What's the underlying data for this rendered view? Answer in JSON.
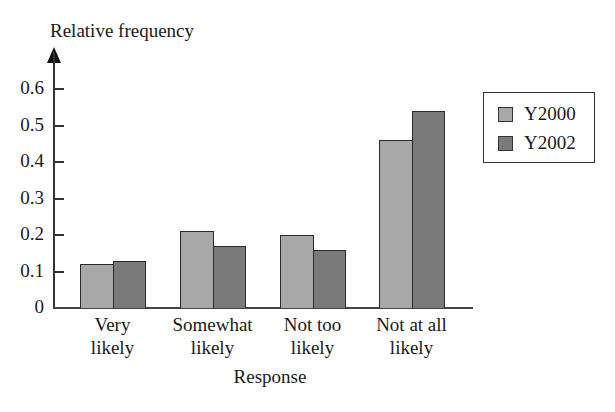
{
  "chart_data": {
    "type": "bar",
    "title": "",
    "xlabel": "Response",
    "ylabel": "Relative frequency",
    "ylim": [
      0,
      0.6
    ],
    "yticks": [
      "0",
      "0.1",
      "0.2",
      "0.3",
      "0.4",
      "0.5",
      "0.6"
    ],
    "categories": [
      "Very likely",
      "Somewhat likely",
      "Not too likely",
      "Not at all likely"
    ],
    "category_lines": [
      [
        "Very",
        "likely"
      ],
      [
        "Somewhat",
        "likely"
      ],
      [
        "Not too",
        "likely"
      ],
      [
        "Not at all",
        "likely"
      ]
    ],
    "series": [
      {
        "name": "Y2000",
        "color": "#a8a8a8",
        "values": [
          0.12,
          0.21,
          0.2,
          0.46
        ]
      },
      {
        "name": "Y2002",
        "color": "#7a7a7a",
        "values": [
          0.13,
          0.17,
          0.16,
          0.54
        ]
      }
    ],
    "legend_position": "right",
    "grid": false
  }
}
